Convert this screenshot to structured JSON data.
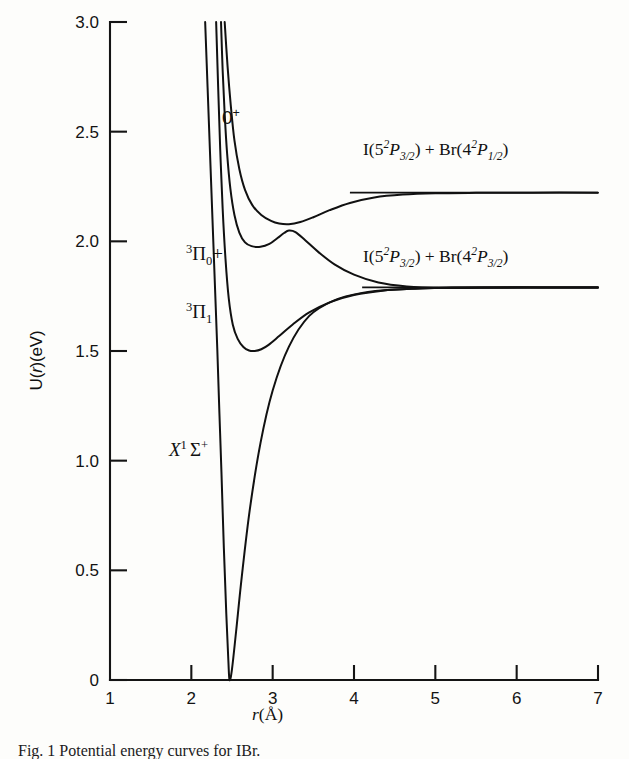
{
  "figure": {
    "caption": "Fig. 1  Potential energy curves for IBr.",
    "background_color": "#fdfdfb",
    "ink_color": "#111111"
  },
  "axes": {
    "x_title_prefix": "r",
    "x_title_suffix": "(Å)",
    "y_title": "U(",
    "y_title_var": "r",
    "y_title_tail": ")(eV)",
    "x_ticks": [
      "1",
      "2",
      "3",
      "4",
      "5",
      "6",
      "7"
    ],
    "y_ticks": [
      "0",
      "0.5",
      "1.0",
      "1.5",
      "2.0",
      "2.5",
      "3.0"
    ]
  },
  "chart_data": {
    "type": "line",
    "xlabel": "r (Å)",
    "ylabel": "U(r) (eV)",
    "xlim": [
      1,
      7
    ],
    "ylim": [
      0,
      3.0
    ],
    "xticks": [
      1,
      2,
      3,
      4,
      5,
      6,
      7
    ],
    "yticks": [
      0,
      0.5,
      1.0,
      1.5,
      2.0,
      2.5,
      3.0
    ],
    "grid": false,
    "legend": "none",
    "annotations": [
      {
        "text": "avoided crossing",
        "x": 3.2,
        "y": 2.05
      }
    ],
    "series": [
      {
        "name": "X1Sigma+",
        "label": "X¹Σ⁺",
        "label_x": 2.52,
        "label_y": 0.97,
        "r_min": 2.47,
        "u_min": 0.0,
        "asymptote": 1.79,
        "points": [
          [
            2.17,
            3.0
          ],
          [
            2.2,
            2.7
          ],
          [
            2.23,
            2.4
          ],
          [
            2.26,
            2.1
          ],
          [
            2.29,
            1.8
          ],
          [
            2.32,
            1.5
          ],
          [
            2.345,
            1.22
          ],
          [
            2.37,
            0.95
          ],
          [
            2.4,
            0.6
          ],
          [
            2.43,
            0.3
          ],
          [
            2.455,
            0.09
          ],
          [
            2.47,
            0.0
          ],
          [
            2.5,
            0.05
          ],
          [
            2.55,
            0.22
          ],
          [
            2.62,
            0.47
          ],
          [
            2.72,
            0.78
          ],
          [
            2.85,
            1.08
          ],
          [
            3.0,
            1.32
          ],
          [
            3.2,
            1.52
          ],
          [
            3.45,
            1.66
          ],
          [
            3.75,
            1.73
          ],
          [
            4.1,
            1.765
          ],
          [
            4.5,
            1.78
          ],
          [
            5.0,
            1.787
          ],
          [
            5.6,
            1.79
          ],
          [
            6.3,
            1.79
          ],
          [
            7.0,
            1.79
          ]
        ]
      },
      {
        "name": "3Pi1",
        "label": "³Π₁",
        "label_x": 2.58,
        "label_y": 1.76,
        "r_min": 2.78,
        "u_min": 1.5,
        "asymptote": 1.79,
        "points": [
          [
            2.305,
            3.0
          ],
          [
            2.33,
            2.7
          ],
          [
            2.355,
            2.42
          ],
          [
            2.385,
            2.15
          ],
          [
            2.42,
            1.92
          ],
          [
            2.46,
            1.74
          ],
          [
            2.51,
            1.62
          ],
          [
            2.57,
            1.555
          ],
          [
            2.64,
            1.518
          ],
          [
            2.71,
            1.502
          ],
          [
            2.78,
            1.5
          ],
          [
            2.86,
            1.508
          ],
          [
            2.95,
            1.528
          ],
          [
            3.08,
            1.568
          ],
          [
            3.25,
            1.622
          ],
          [
            3.45,
            1.676
          ],
          [
            3.7,
            1.722
          ],
          [
            4.0,
            1.755
          ],
          [
            4.35,
            1.775
          ],
          [
            4.75,
            1.784
          ],
          [
            5.2,
            1.789
          ],
          [
            5.8,
            1.79
          ],
          [
            6.4,
            1.79
          ],
          [
            7.0,
            1.79
          ]
        ]
      },
      {
        "name": "3Pi0+",
        "label": "³Π₀⁺",
        "label_x": 2.56,
        "label_y": 2.13,
        "r_min": 2.85,
        "u_min": 1.975,
        "asymptote": 1.79,
        "crossing_r": 3.2,
        "crossing_u": 2.05,
        "points": [
          [
            2.365,
            3.0
          ],
          [
            2.385,
            2.78
          ],
          [
            2.41,
            2.58
          ],
          [
            2.44,
            2.4
          ],
          [
            2.48,
            2.24
          ],
          [
            2.53,
            2.12
          ],
          [
            2.59,
            2.04
          ],
          [
            2.66,
            1.995
          ],
          [
            2.74,
            1.978
          ],
          [
            2.85,
            1.975
          ],
          [
            2.96,
            1.988
          ],
          [
            3.06,
            2.015
          ],
          [
            3.14,
            2.038
          ],
          [
            3.2,
            2.049
          ],
          [
            3.28,
            2.042
          ],
          [
            3.4,
            2.005
          ],
          [
            3.56,
            1.952
          ],
          [
            3.76,
            1.895
          ],
          [
            4.0,
            1.848
          ],
          [
            4.3,
            1.812
          ],
          [
            4.65,
            1.794
          ],
          [
            5.05,
            1.787
          ],
          [
            5.55,
            1.788
          ],
          [
            6.2,
            1.789
          ],
          [
            7.0,
            1.79
          ]
        ]
      },
      {
        "name": "0+",
        "label": "0⁺",
        "label_x": 2.8,
        "label_y": 2.52,
        "asymptote": 2.22,
        "crossing_r": 3.2,
        "crossing_u": 2.08,
        "points": [
          [
            2.41,
            3.0
          ],
          [
            2.445,
            2.8
          ],
          [
            2.485,
            2.62
          ],
          [
            2.53,
            2.46
          ],
          [
            2.59,
            2.33
          ],
          [
            2.66,
            2.235
          ],
          [
            2.75,
            2.165
          ],
          [
            2.86,
            2.12
          ],
          [
            2.98,
            2.093
          ],
          [
            3.08,
            2.081
          ],
          [
            3.2,
            2.078
          ],
          [
            3.34,
            2.088
          ],
          [
            3.5,
            2.11
          ],
          [
            3.7,
            2.142
          ],
          [
            3.95,
            2.175
          ],
          [
            4.25,
            2.2
          ],
          [
            4.6,
            2.213
          ],
          [
            5.0,
            2.219
          ],
          [
            5.5,
            2.221
          ],
          [
            6.2,
            2.222
          ],
          [
            7.0,
            2.222
          ]
        ]
      }
    ],
    "asymptote_rules": [
      {
        "name": "upper-asymptote-rule",
        "y": 2.222,
        "x_start": 3.95,
        "x_end": 7.0
      },
      {
        "name": "lower-asymptote-rule",
        "y": 1.79,
        "x_start": 4.1,
        "x_end": 7.0
      }
    ]
  },
  "labels": {
    "state_0plus": "0",
    "state_0plus_sup": "+",
    "state_3pi0_sup": "3",
    "state_3pi0_main": "Π",
    "state_3pi0_sub": "0",
    "state_3pi0_charge": "+",
    "state_3pi1_sup": "3",
    "state_3pi1_main": "Π",
    "state_3pi1_sub": "1",
    "state_x_main": "X",
    "state_x_sup": "1",
    "state_x_sigma": "Σ",
    "state_x_charge": "+",
    "asym_upper": {
      "i_atom": "I(5",
      "i_sup": "2",
      "i_term": "P",
      "i_sub": "3/2",
      "i_close": ") + Br(4",
      "br_sup": "2",
      "br_term": "P",
      "br_sub": "1/2",
      "br_close": ")"
    },
    "asym_lower": {
      "i_atom": "I(5",
      "i_sup": "2",
      "i_term": "P",
      "i_sub": "3/2",
      "i_close": ") + Br(4",
      "br_sup": "2",
      "br_term": "P",
      "br_sub": "3/2",
      "br_close": ")"
    }
  }
}
